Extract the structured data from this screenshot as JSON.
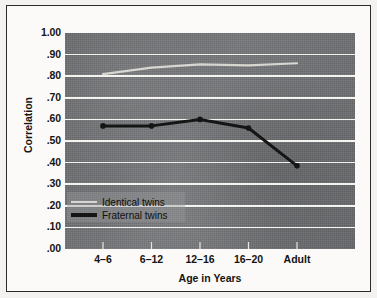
{
  "chart_data": {
    "type": "line",
    "title": "",
    "xlabel": "Age in Years",
    "ylabel": "Correlation",
    "categories": [
      "4–6",
      "6–12",
      "12–16",
      "16–20",
      "Adult"
    ],
    "ylim": [
      0.0,
      1.0
    ],
    "ytick_labels": [
      "1.00",
      ".90",
      ".80",
      ".70",
      ".60",
      ".50",
      ".40",
      ".30",
      ".20",
      ".10",
      ".00"
    ],
    "ytick_values": [
      1.0,
      0.9,
      0.8,
      0.7,
      0.6,
      0.5,
      0.4,
      0.3,
      0.2,
      0.1,
      0.0
    ],
    "grid": true,
    "legend_position": "lower-left-inside",
    "series": [
      {
        "name": "Identical twins",
        "values": [
          0.81,
          0.84,
          0.855,
          0.85,
          0.86
        ],
        "color": "#d8d6d1",
        "markers": false
      },
      {
        "name": "Fraternal twins",
        "values": [
          0.57,
          0.57,
          0.6,
          0.56,
          0.385
        ],
        "color": "#151515",
        "markers": true
      }
    ]
  },
  "axes": {
    "y_title": "Correlation",
    "x_title": "Age in Years"
  },
  "legend": {
    "items": [
      {
        "label": "Identical twins",
        "swatch": "light-line"
      },
      {
        "label": "Fraternal twins",
        "swatch": "dark-line"
      }
    ]
  },
  "colors": {
    "plot_background": "#6f7174",
    "gridline": "#f4f3ef",
    "identical_line": "#d8d6d1",
    "fraternal_line": "#151515",
    "page_background": "#f3f2f0",
    "frame_border": "#2b2b2b"
  }
}
